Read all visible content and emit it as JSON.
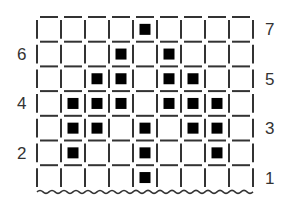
{
  "diagram": {
    "type": "knitting-chart",
    "columns": 9,
    "rows": 7,
    "grid": {
      "left": 37,
      "top": 17,
      "cell_width": 24,
      "cell_height": 24.7
    },
    "row_labels": [
      {
        "row": 1,
        "text": "1",
        "side": "right"
      },
      {
        "row": 2,
        "text": "2",
        "side": "left"
      },
      {
        "row": 3,
        "text": "3",
        "side": "right"
      },
      {
        "row": 4,
        "text": "4",
        "side": "left"
      },
      {
        "row": 5,
        "text": "5",
        "side": "right"
      },
      {
        "row": 6,
        "text": "6",
        "side": "left"
      },
      {
        "row": 7,
        "text": "7",
        "side": "right"
      }
    ],
    "filled_cells": {
      "7": [
        5
      ],
      "6": [
        4,
        6
      ],
      "5": [
        3,
        4,
        6,
        7
      ],
      "4": [
        2,
        3,
        4,
        6,
        7,
        8
      ],
      "3": [
        2,
        3,
        5,
        7,
        8
      ],
      "2": [
        2,
        5,
        8
      ],
      "1": [
        5
      ]
    },
    "bottom_edge": "wavy",
    "colors": {
      "line": "#333333",
      "fill": "#000000",
      "background": "#ffffff"
    }
  }
}
